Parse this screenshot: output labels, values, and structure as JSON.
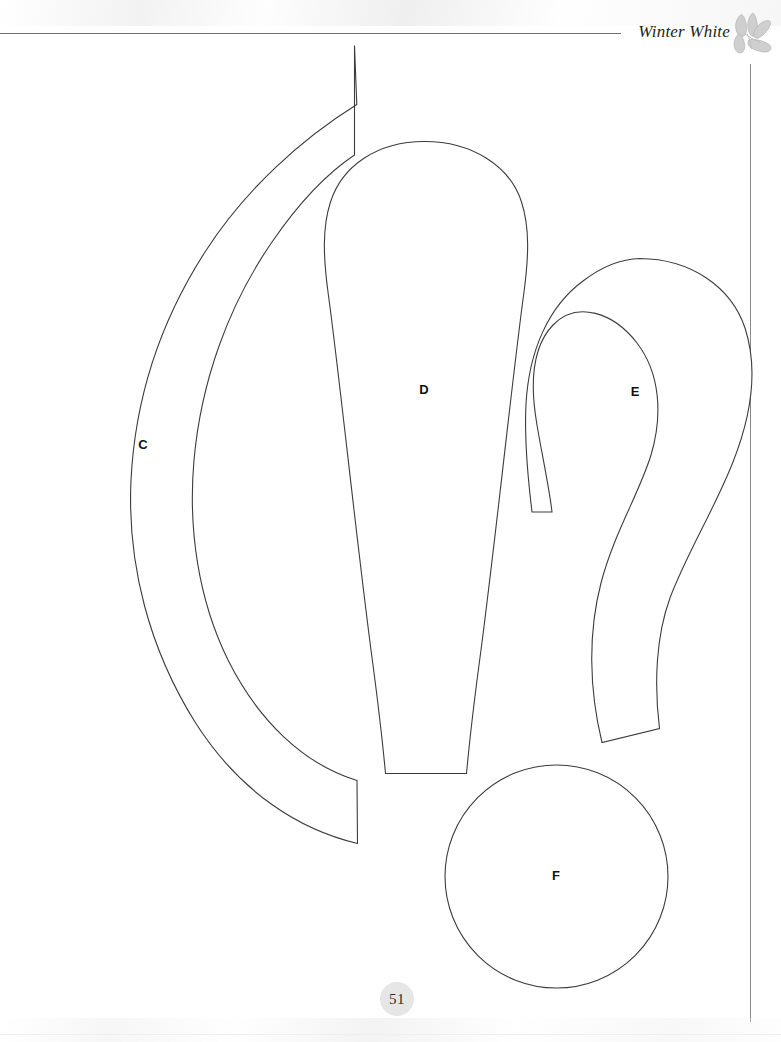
{
  "page": {
    "title": "Winter White",
    "number": "51",
    "background_color": "#ffffff",
    "width": 781,
    "height": 1042
  },
  "header": {
    "title": "Winter White",
    "ornament_name": "leaf-spray-ornament",
    "rule_color": "#6f6f6f"
  },
  "pattern": {
    "caption": "Appliqué pattern pieces",
    "outline_color": "#3c3c3c",
    "fill_color": "#ffffff",
    "pieces": [
      {
        "id": "C",
        "label": "C",
        "shape": "crescent",
        "label_x": 143,
        "label_y": 446,
        "path": "M 354.5 45.5 L 356.8 104.5 C 300 140 245 190 205 252 C 160 322 135 400 131 480 C 127 566 150 650 195 722 C 240 793 300 830 357.5 843.5 L 357.0 780.5 C 303 764 258 720 228 660 C 198 599 188 528 194 460 C 201 382 228 306 272 242 C 296 207 323 176 354.5 155 Z"
      },
      {
        "id": "D",
        "label": "D",
        "shape": "teardrop-long",
        "label_x": 424,
        "label_y": 391,
        "path": "M 424.5 141.5 C 472 141.5 510 166 521.5 202 C 530 228 528.5 258 524 292 C 513 372 497 527 481 650 C 474 702 469 746 466.5 773.5 L 385.5 773.5 C 383 746 378 702 371 650 C 355 527 339 372 328 292 C 323.5 258 322 228 330.5 202 C 342 166 377 141.5 424.5 141.5 Z"
      },
      {
        "id": "E",
        "label": "E",
        "shape": "teardrop-curved",
        "label_x": 635,
        "label_y": 393,
        "path": "M 640 258.5 C 690 259 731 286 745 328 C 758 368 752 414 733 462 C 714 510 687 553 670 598 C 656 636 654 684 659.5 728.5 L 602 742.5 C 589 689 588 633 601 583 C 614 533 639 494 651 455 C 663 415 660 373 637 343 C 614 313 577 300 553 325 C 532 347 530 385 537 425 C 542 455 549 486 552 512 L 532 512 C 528 479 524 442 526 404 C 529 350 549 306 583 281 C 600 268 619 259 640 258.5 Z"
      },
      {
        "id": "F",
        "label": "F",
        "shape": "circle",
        "label_x": 556,
        "label_y": 877,
        "circle": {
          "cx": 556.5,
          "cy": 876.5,
          "r": 111.5
        }
      }
    ]
  }
}
